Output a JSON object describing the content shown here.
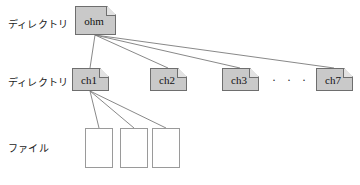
{
  "figure": {
    "width": 360,
    "height": 185,
    "background": "#ffffff"
  },
  "colors": {
    "directory_fill": "#c9c9c9",
    "directory_stroke": "#6e6e6e",
    "file_fill": "#ffffff",
    "file_stroke": "#9a9a9a",
    "edge_stroke": "#7a7a7a",
    "text": "#1a1a1a"
  },
  "row_labels": [
    {
      "id": "row-directory-top",
      "text": "ディレクトリ",
      "x": 8,
      "y": 16
    },
    {
      "id": "row-directory-mid",
      "text": "ディレクトリ",
      "x": 8,
      "y": 74
    },
    {
      "id": "row-file",
      "text": "ファイル",
      "x": 8,
      "y": 140
    }
  ],
  "nodes": {
    "root": {
      "label": "ohm",
      "x": 75,
      "y": 6,
      "w": 41,
      "h": 29
    },
    "directories": [
      {
        "label": "ch1",
        "x": 72,
        "y": 68,
        "w": 37,
        "h": 23
      },
      {
        "label": "ch2",
        "x": 150,
        "y": 68,
        "w": 37,
        "h": 23
      },
      {
        "label": "ch3",
        "x": 222,
        "y": 68,
        "w": 37,
        "h": 23
      },
      {
        "label": "ch7",
        "x": 316,
        "y": 68,
        "w": 37,
        "h": 23
      }
    ],
    "ellipsis": {
      "text": "· · ·",
      "x": 272,
      "y": 73
    },
    "files": [
      {
        "x": 85,
        "y": 128,
        "w": 28,
        "h": 40
      },
      {
        "x": 120,
        "y": 128,
        "w": 28,
        "h": 40
      },
      {
        "x": 152,
        "y": 128,
        "w": 28,
        "h": 40
      }
    ]
  },
  "edges": {
    "root_origin": {
      "x": 95,
      "y": 35
    },
    "from_root": [
      {
        "to_label": "ch1",
        "x2": 90,
        "y2": 68
      },
      {
        "to_label": "ch2",
        "x2": 168,
        "y2": 68
      },
      {
        "to_label": "ch3",
        "x2": 240,
        "y2": 68
      },
      {
        "to_label": "ch7",
        "x2": 334,
        "y2": 68
      }
    ],
    "ch1_origin": {
      "x": 90,
      "y": 91
    },
    "from_ch1": [
      {
        "x2": 99,
        "y2": 128
      },
      {
        "x2": 134,
        "y2": 128
      },
      {
        "x2": 166,
        "y2": 128
      }
    ]
  },
  "caption": {
    "text": "",
    "x": 110,
    "y": 179
  }
}
